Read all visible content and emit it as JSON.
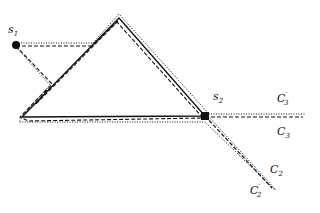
{
  "diagram": {
    "points": [
      {
        "id": "s1",
        "label": "s",
        "subscript": "1"
      },
      {
        "id": "s2",
        "label": "s",
        "subscript": "2"
      }
    ],
    "curves": [
      {
        "id": "C3prime",
        "label": "C",
        "subscript": "3",
        "prime": true,
        "style": "dotted"
      },
      {
        "id": "C3",
        "label": "C",
        "subscript": "3",
        "prime": false,
        "style": "dashed"
      },
      {
        "id": "C2",
        "label": "C",
        "subscript": "2",
        "prime": false,
        "style": "dashed"
      },
      {
        "id": "C2prime",
        "label": "C",
        "subscript": "2",
        "prime": true,
        "style": "dotted"
      }
    ],
    "colors": {
      "ink": "#111111",
      "background": "#ffffff"
    }
  }
}
